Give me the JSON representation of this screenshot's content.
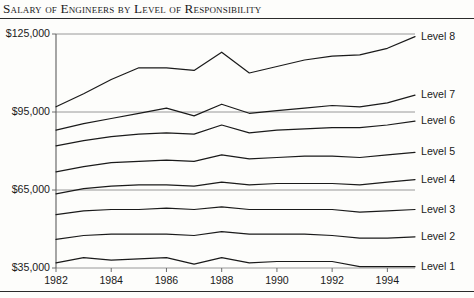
{
  "chart_data": {
    "type": "line",
    "title": "Salary of Engineers by Level of Responsibility",
    "xlabel": "",
    "ylabel": "",
    "xlim": [
      1982,
      1995
    ],
    "ylim": [
      35000,
      125000
    ],
    "ytick_labels": [
      "$125,000",
      "$95,000",
      "$65,000",
      "$35,000"
    ],
    "ytick_values": [
      125000,
      95000,
      65000,
      35000
    ],
    "xtick_labels": [
      "1982",
      "1984",
      "1986",
      "1988",
      "1990",
      "1992",
      "1994"
    ],
    "xtick_values": [
      1982,
      1984,
      1986,
      1988,
      1990,
      1992,
      1994
    ],
    "grid": true,
    "legend_position": "right-inline",
    "x": [
      1982,
      1983,
      1984,
      1985,
      1986,
      1987,
      1988,
      1989,
      1990,
      1991,
      1992,
      1993,
      1994,
      1995
    ],
    "series": [
      {
        "name": "Level 8",
        "values": [
          97000,
          102000,
          107500,
          112000,
          112000,
          111000,
          118000,
          110000,
          112500,
          115000,
          116500,
          117000,
          119500,
          124000
        ]
      },
      {
        "name": "Level 7",
        "values": [
          88000,
          90500,
          92500,
          94500,
          96500,
          93500,
          98000,
          94500,
          95500,
          96500,
          97500,
          97000,
          98500,
          101500
        ]
      },
      {
        "name": "Level 6",
        "values": [
          82000,
          84000,
          85500,
          86500,
          87000,
          86500,
          90000,
          87000,
          88000,
          88500,
          89000,
          89000,
          90000,
          91500
        ]
      },
      {
        "name": "Level 5",
        "values": [
          72000,
          74000,
          75500,
          76000,
          76500,
          76000,
          78500,
          77000,
          77500,
          78000,
          78000,
          77500,
          78500,
          79500
        ]
      },
      {
        "name": "Level 4",
        "values": [
          63500,
          65500,
          66500,
          67000,
          67000,
          66500,
          68000,
          67000,
          67500,
          67500,
          67500,
          67000,
          68000,
          69000
        ]
      },
      {
        "name": "Level 3",
        "values": [
          55500,
          57000,
          57500,
          57500,
          58000,
          57500,
          58500,
          57500,
          57500,
          57500,
          57500,
          56500,
          57000,
          57500
        ]
      },
      {
        "name": "Level 2",
        "values": [
          46000,
          47500,
          48000,
          48000,
          48000,
          47500,
          49000,
          48000,
          48000,
          48000,
          47500,
          46500,
          46500,
          47000
        ]
      },
      {
        "name": "Level 1",
        "values": [
          37000,
          39000,
          38000,
          38500,
          39000,
          36500,
          39000,
          37000,
          37500,
          37500,
          37500,
          35500,
          35500,
          35500
        ]
      }
    ]
  }
}
